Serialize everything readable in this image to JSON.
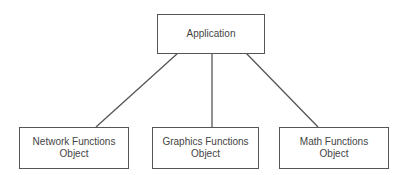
{
  "diagram": {
    "root": {
      "label": "Application"
    },
    "children": [
      {
        "line1": "Network Functions",
        "line2": "Object"
      },
      {
        "line1": "Graphics Functions",
        "line2": "Object"
      },
      {
        "line1": "Math Functions",
        "line2": "Object"
      }
    ],
    "colors": {
      "stroke": "#555555",
      "text": "#444444",
      "background": "#ffffff"
    }
  }
}
